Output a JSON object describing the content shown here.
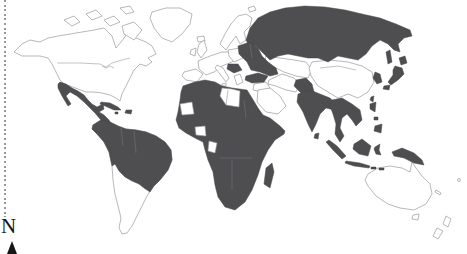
{
  "page": {
    "width": 467,
    "height": 253,
    "background": "#ffffff"
  },
  "map": {
    "type": "world-choropleth",
    "description": "Black-and-white world map with selected countries shaded dark gray; no title, legend or labels visible",
    "colors": {
      "shaded_fill": "#4e4e51",
      "shaded_border": "#46464a",
      "land_fill": "#ffffff",
      "border": "#9a9a9a",
      "inner_border_on_shaded": "#7b7b7e",
      "frame_dotted": "#979797",
      "compass_text": "#161616"
    },
    "shaded_regions": [
      "Mexico",
      "Central America",
      "Cuba",
      "Hispaniola",
      "Northern South America (Colombia, Venezuela, Guianas, Ecuador, Peru, Brazil, Bolivia, Paraguay, Uruguay)",
      "Most of Africa",
      "Madagascar",
      "Eastern Europe (Baltics, Belarus, Ukraine, Caucasus)",
      "Balkan patch",
      "Turkey",
      "Russia",
      "Afghanistan-Pakistan",
      "India",
      "Sri Lanka",
      "Mainland Southeast Asia",
      "Indonesia",
      "Philippines",
      "Taiwan",
      "Korea",
      "Japan",
      "New Guinea"
    ],
    "unshaded_regions": [
      "Canada",
      "United States",
      "Greenland",
      "Iceland",
      "Western and Northern Europe",
      "Libya",
      "Mauritania",
      "West-African coastal patch",
      "Gabon patch",
      "Arabian Peninsula",
      "Iran and Iraq",
      "Kazakhstan and Central Asia",
      "China",
      "Mongolia",
      "Argentina",
      "Chile",
      "Australia",
      "New Zealand",
      "Pacific islands"
    ]
  },
  "compass": {
    "label": "N",
    "icon": "north-arrow-icon"
  }
}
